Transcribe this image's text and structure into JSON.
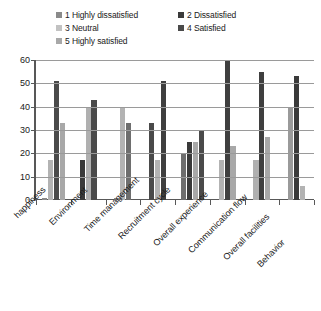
{
  "chart_data": {
    "type": "bar",
    "title": "",
    "xlabel": "",
    "ylabel": "",
    "ylim": [
      0,
      60
    ],
    "yticks": [
      "0",
      "10",
      "20",
      "30",
      "40",
      "50",
      "60"
    ],
    "grid": true,
    "legend_position": "top",
    "categories": [
      "happiness",
      "Environment",
      "Time management",
      "Recruitment cycle",
      "Overall experience",
      "Communication flow",
      "Overall facilities",
      "Behavior"
    ],
    "series": [
      {
        "name": "1 Highly  dissatisfied",
        "color": "#8a8a8a",
        "values": [
          1,
          0,
          1,
          0,
          20,
          0,
          0,
          0
        ]
      },
      {
        "name": "2 Dissatisfied",
        "color": "#3a3a3a",
        "values": [
          0,
          17,
          0,
          33,
          25,
          0,
          0,
          0
        ]
      },
      {
        "name": "3 Neutral",
        "color": "#b3b3b3",
        "values": [
          17,
          0,
          40,
          0,
          0,
          17,
          17,
          40
        ]
      },
      {
        "name": "4 Satisfied",
        "color": "#4a4a4a",
        "values": [
          51,
          40,
          33,
          17,
          25,
          60,
          55,
          53
        ]
      },
      {
        "name": "5 Highly satisfied",
        "color": "#a8a8a8",
        "values": [
          33,
          43,
          0,
          51,
          30,
          23,
          27,
          6
        ]
      }
    ],
    "bars": [
      {
        "category": "happiness",
        "items": [
          {
            "series": "1 Highly  dissatisfied",
            "value": 1,
            "color": "#8a8a8a"
          },
          {
            "series": "3 Neutral",
            "value": 17,
            "color": "#b3b3b3"
          },
          {
            "series": "4 Satisfied",
            "value": 51,
            "color": "#4a4a4a"
          },
          {
            "series": "5 Highly satisfied",
            "value": 33,
            "color": "#a8a8a8"
          }
        ]
      },
      {
        "category": "Environment",
        "items": [
          {
            "series": "2 Dissatisfied",
            "value": 17,
            "color": "#3a3a3a"
          },
          {
            "series": "4 Satisfied",
            "value": 40,
            "color": "#b0b0b0"
          },
          {
            "series": "5 Highly satisfied",
            "value": 43,
            "color": "#4a4a4a"
          }
        ]
      },
      {
        "category": "Time management",
        "items": [
          {
            "series": "1 Highly  dissatisfied",
            "value": 1,
            "color": "#8a8a8a"
          },
          {
            "series": "3 Neutral",
            "value": 40,
            "color": "#b3b3b3"
          },
          {
            "series": "4 Satisfied",
            "value": 33,
            "color": "#6e6e6e"
          }
        ]
      },
      {
        "category": "Recruitment cycle",
        "items": [
          {
            "series": "2 Dissatisfied",
            "value": 33,
            "color": "#4a4a4a"
          },
          {
            "series": "3 Neutral",
            "value": 17,
            "color": "#b3b3b3"
          },
          {
            "series": "5 Highly satisfied",
            "value": 51,
            "color": "#3f3f3f"
          }
        ]
      },
      {
        "category": "Overall experience",
        "items": [
          {
            "series": "1 Highly  dissatisfied",
            "value": 20,
            "color": "#6e6e6e"
          },
          {
            "series": "2 Dissatisfied",
            "value": 25,
            "color": "#3a3a3a"
          },
          {
            "series": "3 Neutral",
            "value": 25,
            "color": "#a8a8a8"
          },
          {
            "series": "4 Satisfied",
            "value": 30,
            "color": "#4a4a4a"
          }
        ]
      },
      {
        "category": "Communication flow",
        "items": [
          {
            "series": "3 Neutral",
            "value": 17,
            "color": "#b3b3b3"
          },
          {
            "series": "4 Satisfied",
            "value": 60,
            "color": "#3f3f3f"
          },
          {
            "series": "5 Highly satisfied",
            "value": 23,
            "color": "#a8a8a8"
          }
        ]
      },
      {
        "category": "Overall facilities",
        "items": [
          {
            "series": "3 Neutral",
            "value": 17,
            "color": "#b0b0b0"
          },
          {
            "series": "4 Satisfied",
            "value": 55,
            "color": "#3f3f3f"
          },
          {
            "series": "5 Highly satisfied",
            "value": 27,
            "color": "#a8a8a8"
          }
        ]
      },
      {
        "category": "Behavior",
        "items": [
          {
            "series": "3 Neutral",
            "value": 40,
            "color": "#9a9a9a"
          },
          {
            "series": "4 Satisfied",
            "value": 53,
            "color": "#3a3a3a"
          },
          {
            "series": "5 Highly satisfied",
            "value": 6,
            "color": "#b3b3b3"
          }
        ]
      }
    ]
  },
  "legend": {
    "items": [
      {
        "label": "1 Highly  dissatisfied",
        "color": "#8a8a8a"
      },
      {
        "label": "2 Dissatisfied",
        "color": "#3a3a3a"
      },
      {
        "label": "3 Neutral",
        "color": "#c2c2c2"
      },
      {
        "label": "4 Satisfied",
        "color": "#4a4a4a"
      },
      {
        "label": "5 Highly satisfied",
        "color": "#a8a8a8"
      }
    ]
  }
}
